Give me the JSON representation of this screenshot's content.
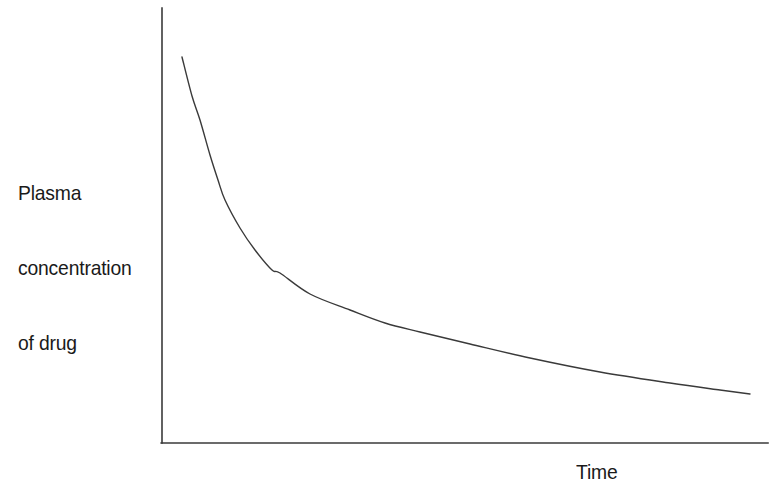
{
  "figure": {
    "background_color": "#ffffff",
    "axis_color": "#3a3a3a",
    "curve_color": "#3a3a3a",
    "text_color": "#1a1a1a"
  },
  "labels": {
    "y_axis": {
      "full": "Plasma concentration of drug",
      "lines": [
        "Plasma",
        "concentration",
        "of drug"
      ]
    },
    "x_axis": {
      "full": "Time"
    }
  },
  "chart_data": {
    "type": "line",
    "title": "",
    "subtitle": "",
    "xlabel": "Time",
    "ylabel": "Plasma concentration of drug",
    "grid": false,
    "legend": false,
    "legend_position": "none",
    "axis_style": "open-L",
    "tick_labels_x": [],
    "tick_labels_y": [],
    "xlim": [
      0,
      1
    ],
    "ylim": [
      0,
      1
    ],
    "annotations": [],
    "series": [
      {
        "name": "Plasma concentration of drug",
        "color": "#3a3a3a",
        "line_width": 1.4,
        "x": [
          0.033,
          0.063,
          0.079,
          0.104,
          0.142,
          0.195,
          0.24,
          0.31,
          0.426,
          0.543,
          0.66,
          0.78,
          0.9,
          0.971
        ],
        "y": [
          0.887,
          0.743,
          0.662,
          0.559,
          0.443,
          0.365,
          0.33,
          0.276,
          0.228,
          0.194,
          0.166,
          0.14,
          0.119,
          0.113
        ]
      }
    ],
    "pixel_geometry": {
      "y_axis_x": 162,
      "y_axis_top": 8,
      "y_axis_bottom": 443,
      "x_axis_y": 443,
      "x_axis_left": 162,
      "x_axis_right": 768,
      "curve_start": [
        182,
        57
      ],
      "curve_end": [
        750,
        394
      ],
      "curve_points": [
        [
          182,
          57
        ],
        [
          192,
          96
        ],
        [
          200,
          120
        ],
        [
          210,
          155
        ],
        [
          218,
          180
        ],
        [
          225,
          200
        ],
        [
          240,
          228
        ],
        [
          255,
          250
        ],
        [
          272,
          270
        ],
        [
          280,
          273
        ],
        [
          310,
          294
        ],
        [
          350,
          310
        ],
        [
          385,
          323
        ],
        [
          420,
          332
        ],
        [
          470,
          344
        ],
        [
          530,
          358
        ],
        [
          600,
          372
        ],
        [
          670,
          383
        ],
        [
          720,
          390
        ],
        [
          750,
          394
        ]
      ]
    }
  }
}
